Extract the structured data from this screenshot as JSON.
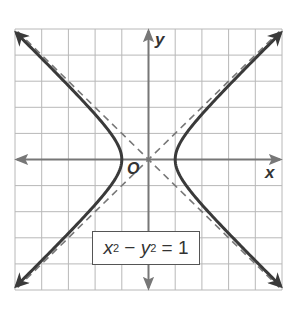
{
  "figure": {
    "equation": {
      "x_var": "x",
      "y_var": "y",
      "exp": "2",
      "minus": " − ",
      "equals": " = ",
      "rhs": "1"
    },
    "axes": {
      "x_label": "x",
      "y_label": "y",
      "origin_label": "O"
    },
    "grid": {
      "x_range": [
        -5,
        5
      ],
      "y_range": [
        -5,
        5
      ],
      "step": 1
    },
    "colors": {
      "grid": "#b8b8b8",
      "axis": "#777777",
      "curve": "#3a3a3a",
      "asymptote": "#777777",
      "box_border": "#555555"
    },
    "curves": [
      {
        "name": "hyperbola",
        "equation": "x^2 - y^2 = 1",
        "style": "solid",
        "vertices": [
          [
            -1,
            0
          ],
          [
            1,
            0
          ]
        ]
      },
      {
        "name": "asymptote-1",
        "equation": "y = x",
        "style": "dashed"
      },
      {
        "name": "asymptote-2",
        "equation": "y = -x",
        "style": "dashed"
      }
    ]
  }
}
